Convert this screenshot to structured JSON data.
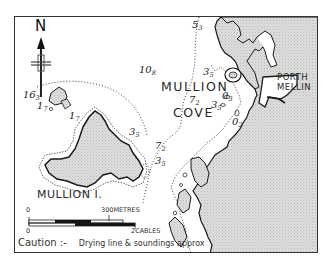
{
  "map": {
    "compass": {
      "label": "N",
      "icon": "north-arrow-icon"
    },
    "places": {
      "mullion": "MULLION",
      "cove": "COVE",
      "porth": "PORTH",
      "mellin": "MELLIN",
      "island": "MULLION I."
    },
    "soundings": [
      {
        "id": "s1",
        "main": "16",
        "sub": "3"
      },
      {
        "id": "s2",
        "main": "10",
        "sub": "8"
      },
      {
        "id": "s3",
        "main": "5",
        "sub": "3"
      },
      {
        "id": "s4",
        "main": "3",
        "sub": "5"
      },
      {
        "id": "s5",
        "main": "7",
        "sub": "2"
      },
      {
        "id": "s6",
        "main": "3",
        "sub": "5"
      },
      {
        "id": "s7",
        "main": "0",
        "sub": "3"
      },
      {
        "id": "s8",
        "main": "0",
        "sub": "2"
      },
      {
        "id": "s9",
        "main": "1",
        "sub": "7"
      },
      {
        "id": "s10",
        "main": "1",
        "sub": "7"
      },
      {
        "id": "s11",
        "main": "3",
        "sub": "5"
      },
      {
        "id": "s12",
        "main": "7",
        "sub": "2"
      },
      {
        "id": "s13",
        "main": "3",
        "sub": "5"
      }
    ],
    "scale": {
      "metres_zero": "0",
      "metres_label": "300METRES",
      "cables_zero": "0",
      "cables_label": "2CABLES"
    },
    "caution": {
      "head": "Caution :-",
      "text": "Drying line & soundings approx"
    },
    "colors": {
      "land": "#d4d4d4",
      "coast": "#1a1a1a",
      "frame": "#333333",
      "sea": "#ffffff"
    }
  }
}
